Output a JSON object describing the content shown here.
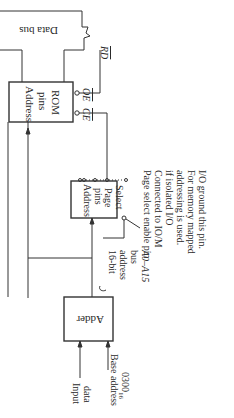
{
  "diagram": {
    "orientation": "rotated 90deg clockwise",
    "data_bus": {
      "label": "Data bus"
    },
    "rom": {
      "line1": "Address",
      "line2": "pins",
      "line3": "ROM",
      "oe_label": "OE",
      "ce_label": "CE"
    },
    "rd_label": "RD",
    "page_select": {
      "line1": "Address",
      "line2": "pins",
      "line3": "Page",
      "line4": "Select"
    },
    "page_select_note": [
      "Page select enable pin",
      "Connected to IO/M",
      "if isolated I/O",
      "addressing is used.",
      "For memory mapped",
      "I/O ground this pin."
    ],
    "address_bus": {
      "line1": "16-bit",
      "line2": "address",
      "line3": "bus",
      "line4": "A0–A15"
    },
    "adder": {
      "label": "Adder"
    },
    "input_data": {
      "line1": "Input",
      "line2": "data"
    },
    "base_address": {
      "line1": "Base address",
      "line2": "0300",
      "line2_sub": "16"
    },
    "colors": {
      "line": "#333333",
      "background": "#ffffff"
    }
  }
}
